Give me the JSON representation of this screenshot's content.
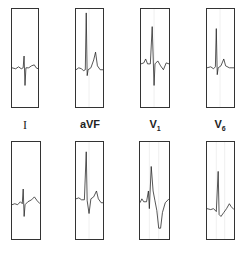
{
  "leads": [
    {
      "label": "I",
      "sub": ""
    },
    {
      "label": "aVF",
      "sub": ""
    },
    {
      "label": "V",
      "sub": "1"
    },
    {
      "label": "V",
      "sub": "6"
    }
  ],
  "rows": [
    "normal",
    "abnormal"
  ],
  "colors": {
    "trace": "#222222",
    "border": "#333333",
    "grid": "#cccccc"
  }
}
